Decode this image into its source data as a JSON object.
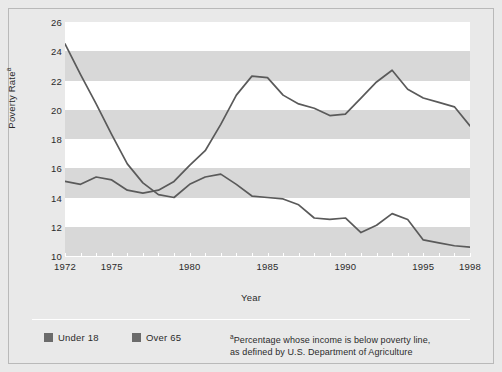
{
  "chart_data": {
    "type": "line",
    "title": "",
    "xlabel": "Year",
    "ylabel": "Poverty Rate",
    "ylabel_superscript": "a",
    "xlim": [
      1972,
      1998
    ],
    "ylim": [
      10,
      26
    ],
    "yticks": [
      10,
      12,
      14,
      16,
      18,
      20,
      22,
      24,
      26
    ],
    "xticks_all": [
      1972,
      1973,
      1974,
      1975,
      1976,
      1977,
      1978,
      1979,
      1980,
      1981,
      1982,
      1983,
      1984,
      1985,
      1986,
      1987,
      1988,
      1989,
      1990,
      1991,
      1992,
      1993,
      1994,
      1995,
      1996,
      1997,
      1998
    ],
    "xtick_labels": [
      {
        "value": 1972,
        "label": "1972"
      },
      {
        "value": 1975,
        "label": "1975"
      },
      {
        "value": 1980,
        "label": "1980"
      },
      {
        "value": 1985,
        "label": "1985"
      },
      {
        "value": 1990,
        "label": "1990"
      },
      {
        "value": 1995,
        "label": "1995"
      },
      {
        "value": 1998,
        "label": "1998"
      }
    ],
    "grid": "horizontal-alternating-bands",
    "legend_position": "bottom-left",
    "line_color": "#5a5a5a",
    "x": [
      1972,
      1973,
      1974,
      1975,
      1976,
      1977,
      1978,
      1979,
      1980,
      1981,
      1982,
      1983,
      1984,
      1985,
      1986,
      1987,
      1988,
      1989,
      1990,
      1991,
      1992,
      1993,
      1994,
      1995,
      1996,
      1997,
      1998
    ],
    "series": [
      {
        "name": "Under 18",
        "color": "#5a5a5a",
        "values": [
          15.1,
          14.9,
          15.4,
          15.2,
          14.5,
          14.3,
          14.5,
          15.1,
          16.2,
          17.2,
          19.0,
          21.0,
          22.3,
          22.2,
          21.0,
          20.4,
          20.1,
          19.6,
          19.7,
          20.8,
          21.9,
          22.7,
          21.4,
          20.8,
          20.5,
          20.2,
          18.9
        ]
      },
      {
        "name": "Over 65",
        "color": "#5a5a5a",
        "values": [
          24.5,
          22.4,
          20.4,
          18.3,
          16.3,
          15.0,
          14.2,
          14.0,
          14.9,
          15.4,
          15.6,
          14.9,
          14.1,
          14.0,
          13.9,
          13.5,
          12.6,
          12.5,
          12.6,
          11.6,
          12.1,
          12.9,
          12.5,
          11.1,
          10.9,
          10.7,
          10.6
        ]
      }
    ]
  },
  "yaxis": {
    "label": "Poverty Rate",
    "superscript": "a",
    "ticks": [
      "26",
      "24",
      "22",
      "20",
      "18",
      "16",
      "14",
      "12",
      "10"
    ]
  },
  "xaxis": {
    "label": "Year",
    "tick_labels": [
      "1972",
      "1975",
      "1980",
      "1985",
      "1990",
      "1995",
      "1998"
    ]
  },
  "legend": {
    "items": [
      {
        "label": "Under 18",
        "color": "#6b6b6b"
      },
      {
        "label": "Over 65",
        "color": "#6b6b6b"
      }
    ]
  },
  "footnote": {
    "marker": "a",
    "line1": "Percentage whose income is below poverty line,",
    "line2": "as defined by U.S. Department of Agriculture"
  },
  "colors": {
    "figure_background": "#e9e9e9",
    "band_light": "#ffffff",
    "band_dark": "#d8d8d8",
    "line": "#5a5a5a",
    "text": "#2b2b2b",
    "axis": "#ffffff",
    "border": "#b9b9b9"
  }
}
